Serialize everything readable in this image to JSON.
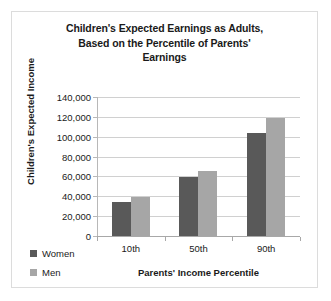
{
  "chart_data": {
    "type": "bar",
    "title": "Children's Expected Earnings as Adults, Based on the Percentile of Parents' Earnings",
    "title_lines": [
      "Children's Expected Earnings as Adults,",
      "Based on the Percentile of Parents'",
      "Earnings"
    ],
    "xlabel": "Parents' Income Percentile",
    "ylabel": "Children's Expected Income",
    "categories": [
      "10th",
      "50th",
      "90th"
    ],
    "series": [
      {
        "name": "Women",
        "color": "#595959",
        "values": [
          34000,
          59000,
          104000
        ]
      },
      {
        "name": "Men",
        "color": "#a6a6a6",
        "values": [
          39000,
          65000,
          119000
        ]
      }
    ],
    "ylim": [
      0,
      140000
    ],
    "ytick_step": 20000,
    "ytick_labels": [
      "140,000",
      "120,000",
      "100,000",
      "80,000",
      "60,000",
      "40,000",
      "20,000",
      "0"
    ],
    "ytick_values": [
      140000,
      120000,
      100000,
      80000,
      60000,
      40000,
      20000,
      0
    ],
    "grid": true,
    "legend_position": "bottom-left",
    "border_color": "#dcdcdc",
    "gridline_color": "#d0d0d0"
  }
}
